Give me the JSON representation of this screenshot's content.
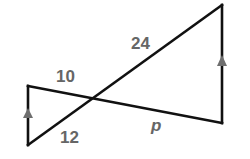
{
  "diagram": {
    "type": "geometry-figure",
    "colors": {
      "line": "#111111",
      "label": "#666666",
      "arrow": "#6e6e6e"
    },
    "points": {
      "left_top": [
        28,
        86
      ],
      "left_bottom": [
        28,
        145
      ],
      "intersection": [
        93,
        97
      ],
      "right_top": [
        222,
        5
      ],
      "right_bottom": [
        222,
        123
      ]
    },
    "segments": [
      {
        "name": "left-vertical-side",
        "from": "left_bottom",
        "to": "left_top",
        "parallel_mark": true
      },
      {
        "name": "right-vertical-side",
        "from": "right_bottom",
        "to": "right_top",
        "parallel_mark": true
      },
      {
        "name": "transversal-ascending",
        "from": "left_bottom",
        "to": "right_top"
      },
      {
        "name": "transversal-descending",
        "from": "left_top",
        "to": "right_bottom"
      }
    ],
    "labels": {
      "segment_10": {
        "text": "10",
        "x": 56,
        "y": 82
      },
      "segment_24": {
        "text": "24",
        "x": 131,
        "y": 49
      },
      "segment_12": {
        "text": "12",
        "x": 60,
        "y": 143
      },
      "segment_p": {
        "text": "p",
        "x": 151,
        "y": 131
      }
    }
  }
}
